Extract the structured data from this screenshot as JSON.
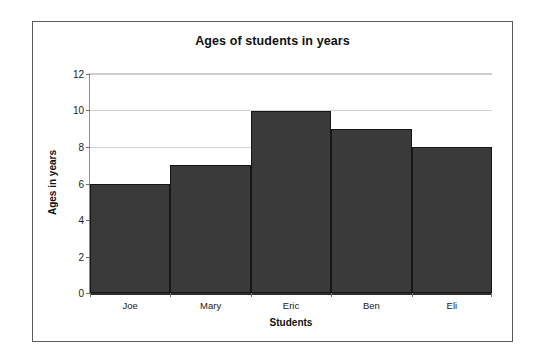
{
  "figure": {
    "background_color": "#ffffff",
    "frame_color": "#5a5a60"
  },
  "chart_data": {
    "type": "bar",
    "title": "Ages of students in years",
    "xlabel": "Students",
    "ylabel": "Ages in years",
    "categories": [
      "Joe",
      "Mary",
      "Eric",
      "Ben",
      "Eli"
    ],
    "values": [
      6,
      7,
      10,
      9,
      8
    ],
    "ylim": [
      0,
      12
    ],
    "ytick_labels": [
      "0",
      "2",
      "4",
      "6",
      "8",
      "10",
      "12"
    ],
    "ytick_values": [
      0,
      2,
      4,
      6,
      8,
      10,
      12
    ],
    "grid": true,
    "grid_axis": "y",
    "legend": false,
    "bar_gap": 0,
    "bar_color": "#3a3a3a",
    "bar_edge_color": "#161616",
    "gridline_color": "#d2d2d4",
    "axis_color": "#2e2e2e"
  },
  "artifacts": {
    "bleed_text_1": "ars",
    "bleed_text_2": "",
    "bleed_text_3": "",
    "bleed_text_4": ""
  }
}
